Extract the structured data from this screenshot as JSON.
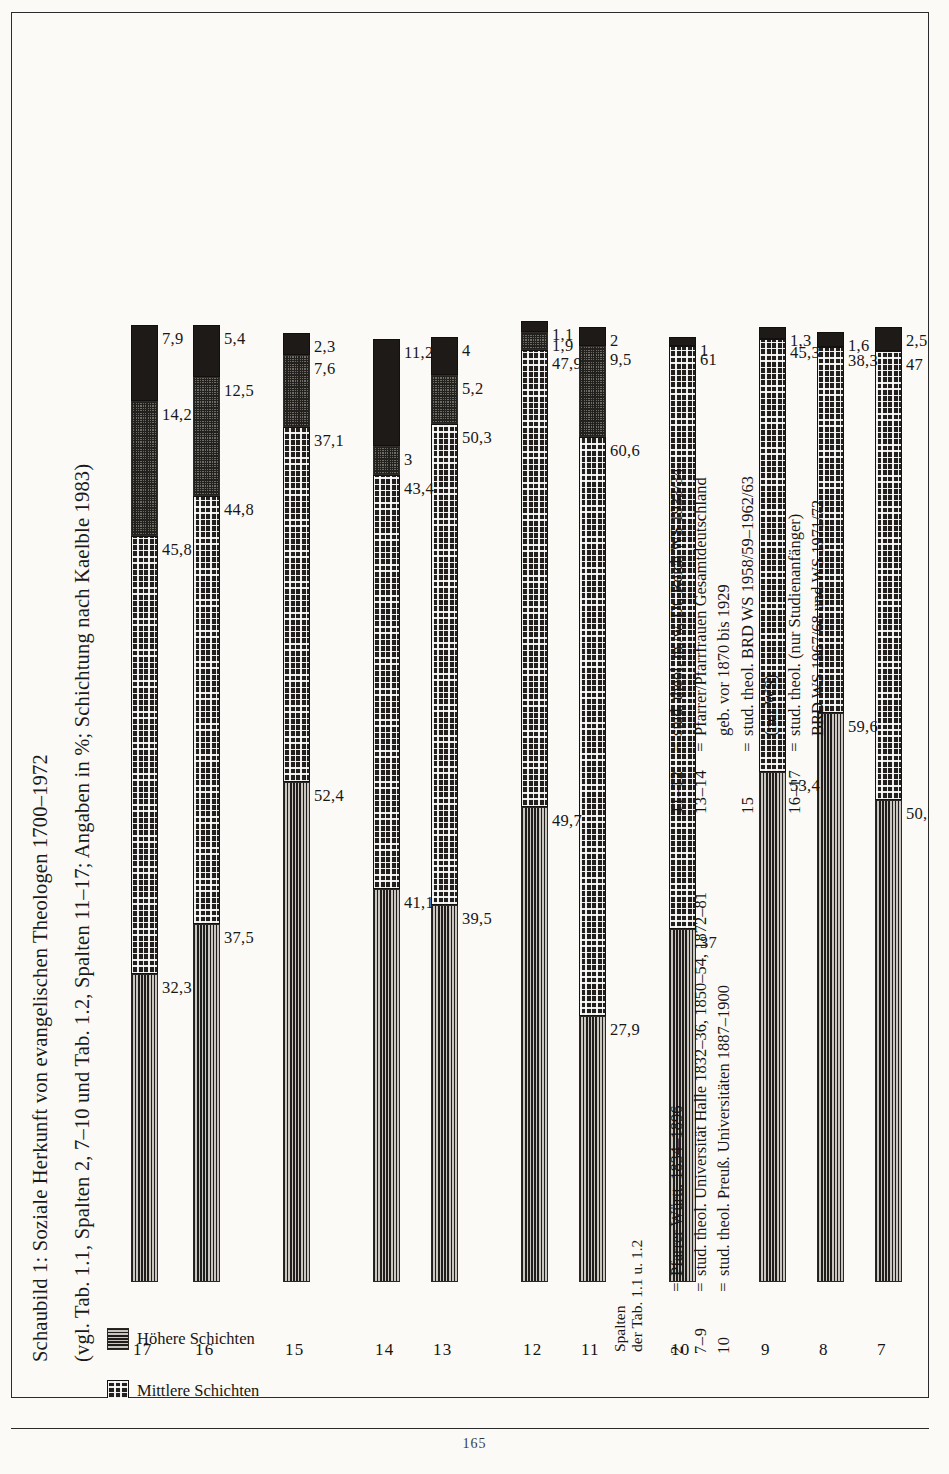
{
  "page": {
    "number": "165"
  },
  "figure": {
    "title_line1": "Schaubild 1: Soziale Herkunft von evangelischen Theologen 1700–1972",
    "title_line2": "(vgl. Tab. 1.1, Spalten 2, 7–10 und Tab. 1.2, Spalten 11–17; Angaben in %; Schichtung nach Kaelble 1983)"
  },
  "legend": {
    "items": [
      {
        "label": "Höhere Schichten",
        "label2": "",
        "pattern": "horizontal-lines",
        "color": "#8d8a85"
      },
      {
        "label": "Mittlere Schichten",
        "label2": "",
        "pattern": "dot-grid",
        "color": "#231f1d"
      },
      {
        "label": "Untere Schichten",
        "label2": "",
        "pattern": "fine-stipple",
        "color": "#6e6a64"
      },
      {
        "label": "Sonstige,",
        "label2": "ohne Angaben",
        "pattern": "solid",
        "color": "#1d1a18"
      }
    ]
  },
  "spalten_header": {
    "line1": "Spalten",
    "line2": "der Tab. 1.1 u. 1.2"
  },
  "footnotes_left": [
    {
      "key": "2",
      "eq": "=",
      "value": "Pfarrer Württ. 1834–1896",
      "cont": ""
    },
    {
      "key": "7–9",
      "eq": "=",
      "value": "stud. theol. Universität Halle 1832–36, 1850–54, 1872–81",
      "cont": ""
    },
    {
      "key": "10",
      "eq": "=",
      "value": "stud. theol. Preuß. Universitäten 1887–1900",
      "cont": ""
    }
  ],
  "footnotes_right": [
    {
      "key": "11–12",
      "eq": "=",
      "value": "stud. theol. m./w. Dt. Reich WS 1933/34",
      "cont": ""
    },
    {
      "key": "13–14",
      "eq": "=",
      "value": "Pfarrer/Pfarrfrauen Gesamtdeutschland",
      "cont": "geb. vor 1870 bis 1929"
    },
    {
      "key": "15",
      "eq": "=",
      "value": "stud. theol. BRD WS 1958/59–1962/63",
      "cont": "(nur WS)"
    },
    {
      "key": "16–17",
      "eq": "=",
      "value": "stud. theol. (nur Studienanfänger)",
      "cont": "BRD WS 1967/68 und WS 1971/72"
    }
  ],
  "chart_data": {
    "type": "bar",
    "orientation": "horizontal-stacked",
    "title": "Schaubild 1: Soziale Herkunft von evangelischen Theologen 1700–1972",
    "subtitle": "(vgl. Tab. 1.1, Spalten 2, 7–10 und Tab. 1.2, Spalten 11–17; Angaben in %; Schichtung nach Kaelble 1983)",
    "xlabel": "",
    "ylabel": "Spalten der Tab. 1.1 u. 1.2",
    "xlim": [
      0,
      100
    ],
    "grid": false,
    "legend_position": "left",
    "categories": [
      "2",
      "7",
      "8",
      "9",
      "10",
      "11",
      "12",
      "13",
      "14",
      "15",
      "16",
      "17"
    ],
    "series": [
      {
        "name": "Höhere Schichten",
        "values": [
          49.5,
          50.5,
          59.6,
          53.4,
          37,
          27.9,
          49.7,
          39.5,
          41.1,
          52.4,
          37.5,
          32.3
        ]
      },
      {
        "name": "Mittlere Schichten",
        "values": [
          47.2,
          47,
          38.3,
          45.3,
          61,
          60.6,
          47.9,
          50.3,
          43.4,
          37.1,
          44.8,
          45.8
        ]
      },
      {
        "name": "Untere Schichten",
        "values": [
          0,
          0,
          0,
          0,
          0,
          9.5,
          1.9,
          5.2,
          3,
          7.6,
          12.5,
          14.2
        ]
      },
      {
        "name": "Sonstige, ohne Angaben",
        "values": [
          2,
          2.5,
          1.6,
          1.3,
          1,
          2,
          1.1,
          4,
          11.2,
          2.3,
          5.4,
          7.9
        ]
      }
    ],
    "value_labels": [
      {
        "category": "2",
        "labels": [
          "49,5",
          "47,2",
          "",
          "2"
        ]
      },
      {
        "category": "7",
        "labels": [
          "50,5",
          "47",
          "",
          "2,5"
        ]
      },
      {
        "category": "8",
        "labels": [
          "59,6",
          "38,3",
          "",
          "1,6"
        ]
      },
      {
        "category": "9",
        "labels": [
          "53,4",
          "45,3",
          "",
          "1,3"
        ]
      },
      {
        "category": "10",
        "labels": [
          "37",
          "61",
          "",
          "1"
        ]
      },
      {
        "category": "11",
        "labels": [
          "27,9",
          "60,6",
          "9,5",
          "2"
        ]
      },
      {
        "category": "12",
        "labels": [
          "49,7",
          "47,9",
          "1,9",
          "1,1"
        ]
      },
      {
        "category": "13",
        "labels": [
          "39,5",
          "50,3",
          "5,2",
          "4"
        ]
      },
      {
        "category": "14",
        "labels": [
          "41,1",
          "43,4",
          "3",
          "11,2"
        ]
      },
      {
        "category": "15",
        "labels": [
          "52,4",
          "37,1",
          "7,6",
          "2,3"
        ]
      },
      {
        "category": "16",
        "labels": [
          "37,5",
          "44,8",
          "12,5",
          "5,4"
        ]
      },
      {
        "category": "17",
        "labels": [
          "32,3",
          "45,8",
          "14,2",
          "7,9"
        ]
      }
    ]
  }
}
